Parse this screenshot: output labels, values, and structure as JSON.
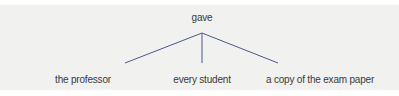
{
  "diagram": {
    "type": "tree",
    "root": {
      "label": "gave"
    },
    "children": [
      {
        "label": "the professor"
      },
      {
        "label": "every student"
      },
      {
        "label": "a copy of the exam paper"
      }
    ],
    "edge_color": "#4a5a8a",
    "background_color": "#f1f1f0"
  }
}
